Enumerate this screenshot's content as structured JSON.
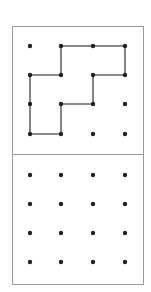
{
  "diagram": {
    "colors": {
      "border": "#9a9a9a",
      "dot": "#222222",
      "line": "#666666",
      "background": "#ffffff"
    },
    "grid": {
      "cols": 4,
      "rows": 4,
      "x": [
        30,
        61,
        93,
        125
      ]
    },
    "top_panel": {
      "rows_y": [
        46,
        75,
        104,
        134
      ],
      "shape_path_grid": [
        [
          1,
          0
        ],
        [
          2,
          0
        ],
        [
          3,
          0
        ],
        [
          3,
          1
        ],
        [
          2,
          1
        ],
        [
          2,
          2
        ],
        [
          1,
          2
        ],
        [
          1,
          3
        ],
        [
          0,
          3
        ],
        [
          0,
          2
        ],
        [
          0,
          1
        ],
        [
          1,
          1
        ],
        [
          1,
          0
        ]
      ]
    },
    "bottom_panel": {
      "rows_y": [
        175,
        204,
        233,
        262
      ]
    }
  }
}
